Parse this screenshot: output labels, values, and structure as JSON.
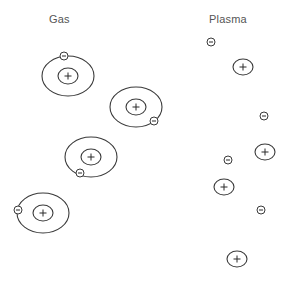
{
  "labels": {
    "gas": "Gas",
    "plasma": "Plasma"
  },
  "colors": {
    "line": "#3a3a3a",
    "text": "#555555",
    "background": "#ffffff"
  },
  "gas": {
    "label_position": {
      "x": 49,
      "y": 13
    },
    "atoms": [
      {
        "center": [
          68,
          76
        ],
        "electron": [
          64,
          56
        ]
      },
      {
        "center": [
          136,
          107
        ],
        "electron": [
          154,
          121
        ]
      },
      {
        "center": [
          91,
          157
        ],
        "electron": [
          80,
          173
        ]
      },
      {
        "center": [
          43,
          213
        ],
        "electron": [
          18,
          210
        ]
      }
    ],
    "orbit": {
      "rx": 26,
      "ry": 20
    },
    "nucleus": {
      "rx": 10,
      "ry": 8,
      "symbol": "+"
    },
    "electron": {
      "r": 4,
      "symbol": "−"
    }
  },
  "plasma": {
    "label_position": {
      "x": 209,
      "y": 13
    },
    "ions": [
      {
        "center": [
          243,
          67
        ],
        "symbol": "+"
      },
      {
        "center": [
          265,
          152
        ],
        "symbol": "+"
      },
      {
        "center": [
          224,
          187
        ],
        "symbol": "+"
      },
      {
        "center": [
          237,
          259
        ],
        "symbol": "+"
      }
    ],
    "electrons": [
      {
        "center": [
          211,
          42
        ],
        "symbol": "−"
      },
      {
        "center": [
          264,
          116
        ],
        "symbol": "−"
      },
      {
        "center": [
          228,
          160
        ],
        "symbol": "−"
      },
      {
        "center": [
          261,
          210
        ],
        "symbol": "−"
      }
    ],
    "ion_size": {
      "rx": 10,
      "ry": 8
    },
    "electron_size": {
      "r": 4
    }
  }
}
